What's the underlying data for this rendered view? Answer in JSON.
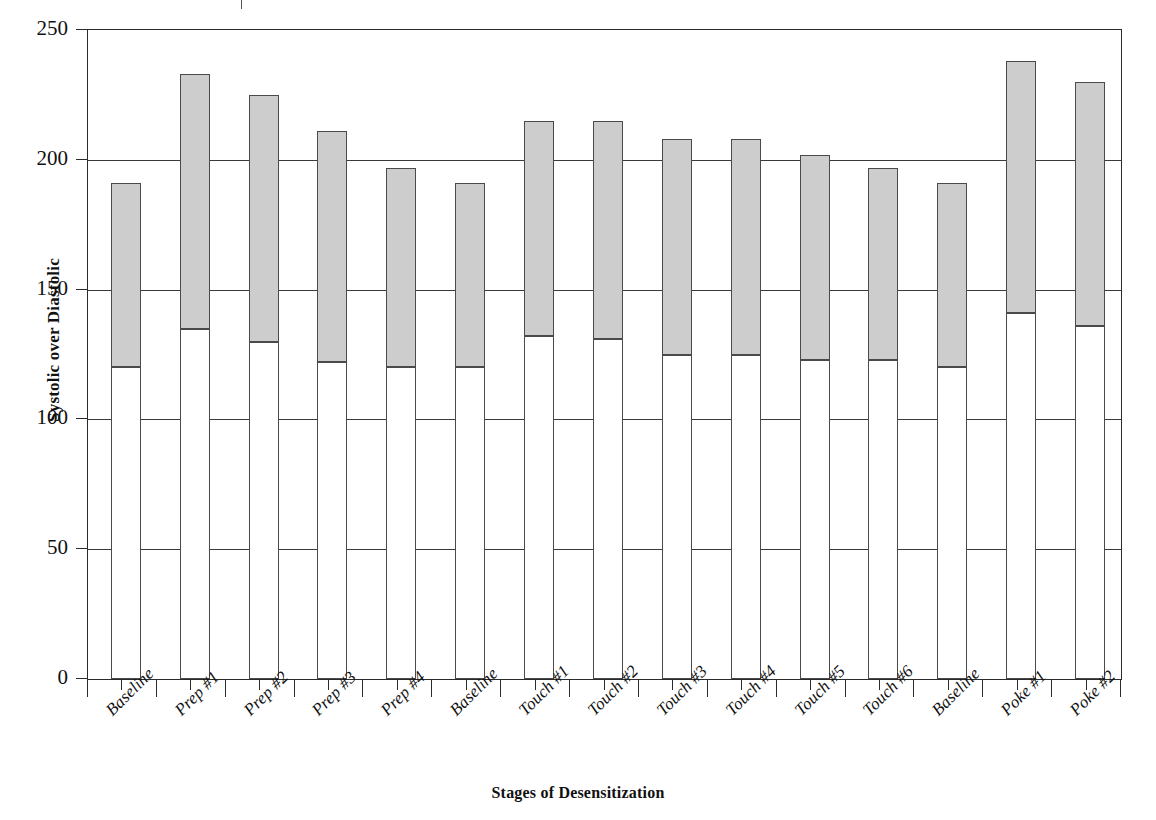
{
  "chart_data": {
    "type": "bar",
    "subtype": "stacked-bar",
    "title": "",
    "xlabel": "Stages of Desensitization",
    "ylabel": "Systolic over Diastolic",
    "ylim": [
      0,
      250
    ],
    "ytick_labels": [
      "0",
      "50",
      "100",
      "150",
      "200",
      "250"
    ],
    "ytick_values": [
      0,
      50,
      100,
      150,
      200,
      250
    ],
    "grid": true,
    "legend": "none",
    "categories": [
      "Baseline",
      "Prep #1",
      "Prep #2",
      "Prep #3",
      "Prep #4",
      "Baseline",
      "Touch #1",
      "Touch #2",
      "Touch #3",
      "Touch #4",
      "Touch #5",
      "Touch #6",
      "Baseline",
      "Poke #1",
      "Poke #2"
    ],
    "series": [
      {
        "name": "Diastolic",
        "color": "#ffffff",
        "values": [
          120,
          135,
          130,
          122,
          120,
          120,
          132,
          131,
          125,
          125,
          123,
          123,
          120,
          141,
          136
        ]
      },
      {
        "name": "Systolic",
        "color": "#cdcdcd",
        "values": [
          191,
          233,
          225,
          211,
          197,
          191,
          215,
          215,
          208,
          208,
          202,
          197,
          191,
          238,
          230
        ]
      }
    ]
  },
  "axes": {
    "y_title": "Systolic over Diastolic",
    "x_title": "Stages of Desensitization"
  }
}
